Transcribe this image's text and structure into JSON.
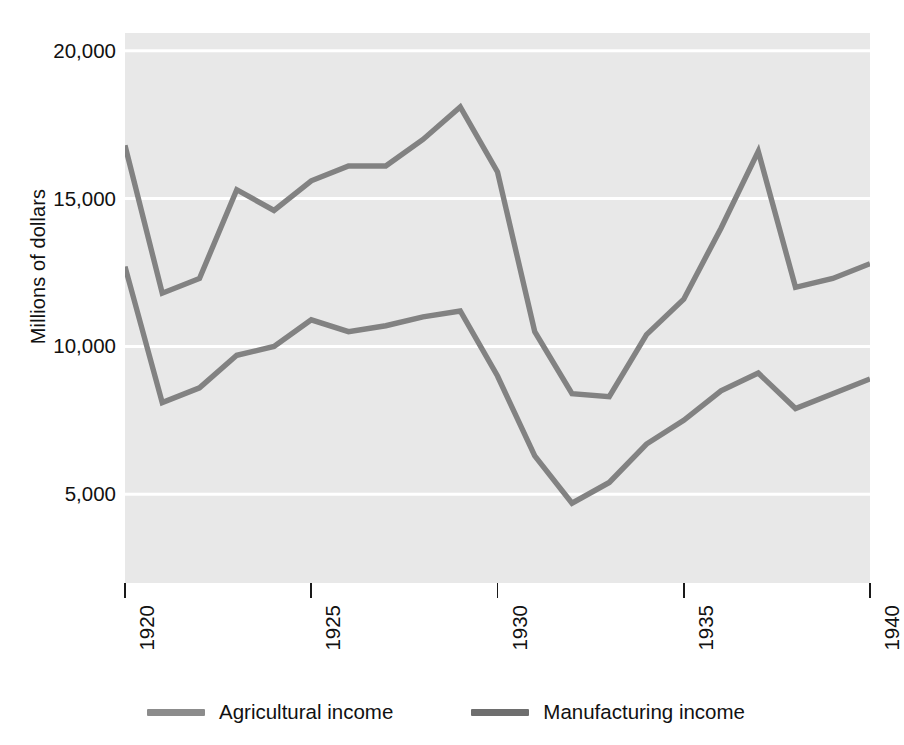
{
  "chart_data": {
    "type": "line",
    "title": "",
    "subtitle": "",
    "xlabel": "",
    "ylabel": "Millions of dollars",
    "xlim": [
      1920,
      1940
    ],
    "ylim": [
      2000,
      20600
    ],
    "grid": true,
    "grid_color": "#ffffff",
    "plot_background": "#e8e8e8",
    "legend_position": "bottom",
    "y_ticks": [
      {
        "value": 20000,
        "label": "20,000"
      },
      {
        "value": 15000,
        "label": "15,000"
      },
      {
        "value": 10000,
        "label": "10,000"
      },
      {
        "value": 5000,
        "label": "5,000"
      }
    ],
    "x_ticks": [
      {
        "value": 1920,
        "label": "1920"
      },
      {
        "value": 1925,
        "label": "1925"
      },
      {
        "value": 1930,
        "label": "1930"
      },
      {
        "value": 1935,
        "label": "1935"
      },
      {
        "value": 1940,
        "label": "1940"
      }
    ],
    "x": [
      1920,
      1921,
      1922,
      1923,
      1924,
      1925,
      1926,
      1927,
      1928,
      1929,
      1930,
      1931,
      1932,
      1933,
      1934,
      1935,
      1936,
      1937,
      1938,
      1939,
      1940
    ],
    "series": [
      {
        "name": "Agricultural income",
        "color": "#828282",
        "values": [
          16800,
          11800,
          12300,
          15300,
          14600,
          15600,
          16100,
          16100,
          17000,
          18100,
          15900,
          10500,
          8400,
          8300,
          10400,
          11600,
          14000,
          16600,
          12000,
          12300,
          12800
        ]
      },
      {
        "name": "Manufacturing income",
        "color": "#828282",
        "values": [
          12700,
          8100,
          8600,
          9700,
          10000,
          10900,
          10500,
          10700,
          11000,
          11200,
          9000,
          6300,
          4700,
          5400,
          6700,
          7500,
          8500,
          9100,
          7900,
          8400,
          8900
        ]
      }
    ]
  },
  "legend": {
    "items": [
      {
        "label": "Agricultural income",
        "color": "#8c8c8c"
      },
      {
        "label": "Manufacturing income",
        "color": "#6e6e6e"
      }
    ]
  }
}
